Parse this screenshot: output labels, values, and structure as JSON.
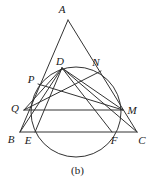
{
  "figure": {
    "caption": "(b)",
    "stroke_color": "#333333",
    "label_color": "#1a1a1a",
    "background_color": "#ffffff",
    "width": 155,
    "height": 184,
    "points": [
      {
        "id": "A",
        "label": "A",
        "x": 68,
        "y": 20,
        "label_x": 62,
        "label_y": 9
      },
      {
        "id": "D",
        "label": "D",
        "x": 62,
        "y": 68,
        "label_x": 60,
        "label_y": 61
      },
      {
        "id": "N",
        "label": "N",
        "x": 101,
        "y": 71,
        "label_x": 96,
        "label_y": 62
      },
      {
        "id": "P",
        "label": "P",
        "x": 38,
        "y": 84,
        "label_x": 31,
        "label_y": 79
      },
      {
        "id": "Q",
        "label": "Q",
        "x": 24,
        "y": 110,
        "label_x": 15,
        "label_y": 108
      },
      {
        "id": "M",
        "label": "M",
        "x": 123,
        "y": 110,
        "label_x": 132,
        "label_y": 110
      },
      {
        "id": "B",
        "label": "B",
        "x": 20,
        "y": 132,
        "label_x": 11,
        "label_y": 139
      },
      {
        "id": "E",
        "label": "E",
        "x": 35,
        "y": 132,
        "label_x": 28,
        "label_y": 140
      },
      {
        "id": "F",
        "label": "F",
        "x": 112,
        "y": 132,
        "label_x": 114,
        "label_y": 140
      },
      {
        "id": "C",
        "label": "C",
        "x": 137,
        "y": 132,
        "label_x": 142,
        "label_y": 140
      }
    ],
    "circle": {
      "cx": 76,
      "cy": 112,
      "r": 45
    },
    "segments": [
      {
        "name": "side-AB",
        "from": "A",
        "to": "B"
      },
      {
        "name": "side-AC",
        "from": "A",
        "to": "C"
      },
      {
        "name": "base-BC",
        "from": "B",
        "to": "C"
      },
      {
        "name": "chord-QM",
        "from": "Q",
        "to": "M"
      },
      {
        "name": "chord-DQ",
        "from": "D",
        "to": "Q"
      },
      {
        "name": "chord-DM",
        "from": "D",
        "to": "M"
      },
      {
        "name": "chord-DE",
        "from": "D",
        "to": "E"
      },
      {
        "name": "chord-DF",
        "from": "D",
        "to": "F"
      },
      {
        "name": "chord-DB",
        "from": "D",
        "to": "B"
      },
      {
        "name": "chord-DC",
        "from": "D",
        "to": "C"
      },
      {
        "name": "chord-QN",
        "from": "Q",
        "to": "N"
      },
      {
        "name": "chord-PM",
        "from": "P",
        "to": "M"
      }
    ]
  }
}
